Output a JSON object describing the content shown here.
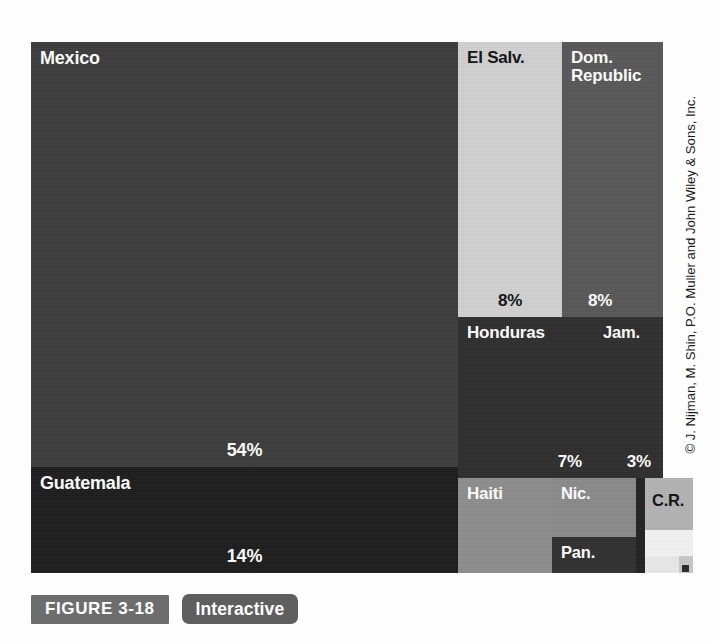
{
  "figure": {
    "badge_label": "FIGURE 3-18",
    "interactive_label": "Interactive",
    "credit": "© J. Nijman, M. Shin, P.O. Muller and John Wiley & Sons, Inc."
  },
  "chart_data": {
    "type": "treemap",
    "title": "",
    "subtitle": "",
    "xlabel": "",
    "ylabel": "",
    "units": "percent of total",
    "grid": false,
    "legend": "none",
    "value_label_suffix": "%",
    "categories": [
      "Mexico",
      "Guatemala",
      "El Salv.",
      "Dom. Republic",
      "Honduras",
      "Jam.",
      "Haiti",
      "Nic.",
      "Pan.",
      "C.R."
    ],
    "values": [
      54,
      14,
      8,
      8,
      7,
      3,
      3,
      2,
      1,
      1
    ],
    "items": [
      {
        "name": "Mexico",
        "value": 54,
        "label": "54%",
        "color": "#3c3c3c",
        "text_color": "#ffffff",
        "x": 0,
        "y": 0,
        "w": 427,
        "h": 425
      },
      {
        "name": "Guatemala",
        "value": 14,
        "label": "14%",
        "color": "#1d1d1d",
        "text_color": "#ffffff",
        "x": 0,
        "y": 425,
        "w": 427,
        "h": 106
      },
      {
        "name": "El Salv.",
        "value": 8,
        "label": "8%",
        "color": "#d2d2d2",
        "text_color": "#111111",
        "x": 427,
        "y": 0,
        "w": 104,
        "h": 275
      },
      {
        "name": "Dom.\nRepublic",
        "value": 8,
        "label": "8%",
        "color": "#585858",
        "text_color": "#ffffff",
        "x": 531,
        "y": 0,
        "w": 101,
        "h": 275
      },
      {
        "name": "Honduras",
        "value": 7,
        "label": "7%",
        "color": "#2e2e2e",
        "text_color": "#ffffff",
        "x": 427,
        "y": 275,
        "w": 136,
        "h": 161
      },
      {
        "name": "Jam.",
        "value": 3,
        "label": "3%",
        "color": "#2e2e2e",
        "text_color": "#ffffff",
        "x": 563,
        "y": 275,
        "w": 69,
        "h": 161
      },
      {
        "name": "Haiti",
        "value": 3,
        "label": "",
        "color": "#8e8e8e",
        "text_color": "#ffffff",
        "x": 427,
        "y": 436,
        "w": 94,
        "h": 95
      },
      {
        "name": "Nic.",
        "value": 2,
        "label": "",
        "color": "#8b8b8b",
        "text_color": "#ffffff",
        "x": 521,
        "y": 436,
        "w": 84,
        "h": 59
      },
      {
        "name": "Pan.",
        "value": 1,
        "label": "",
        "color": "#303030",
        "text_color": "#ffffff",
        "x": 521,
        "y": 495,
        "w": 84,
        "h": 36
      },
      {
        "name": "C.R.",
        "value": 1,
        "label": "",
        "color": "#b4b4b4",
        "text_color": "#111111",
        "x": 614,
        "y": 436,
        "w": 48,
        "h": 52
      }
    ],
    "minor_cells": [
      {
        "name": "unlabeled-dark-strip",
        "color": "#232323",
        "x": 605,
        "y": 436,
        "w": 9,
        "h": 95
      },
      {
        "name": "unlabeled-white-a",
        "color": "#f4f4f4",
        "x": 614,
        "y": 488,
        "w": 48,
        "h": 26
      },
      {
        "name": "unlabeled-white-b",
        "color": "#eaeaea",
        "x": 614,
        "y": 514,
        "w": 34,
        "h": 17
      },
      {
        "name": "unlabeled-gray-c",
        "color": "#c9c9c9",
        "x": 648,
        "y": 514,
        "w": 14,
        "h": 17
      },
      {
        "name": "unlabeled-dot",
        "color": "#2a2a2a",
        "x": 651,
        "y": 523,
        "w": 7,
        "h": 7
      }
    ]
  }
}
